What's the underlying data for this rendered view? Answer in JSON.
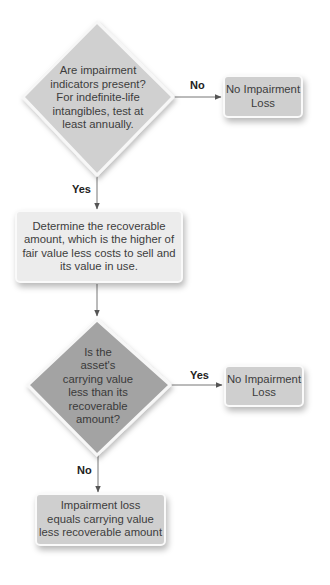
{
  "diagram": {
    "type": "flowchart",
    "title": "",
    "colors": {
      "diamond_light": "#d0d0d0",
      "diamond_dark": "#a3a3a3",
      "box_mid": "#cfcfcf",
      "box_light": "#ececec",
      "connector": "#555555",
      "text": "#3d3d3d",
      "edge_label": "#222222"
    },
    "nodes": {
      "decision_indicators": {
        "shape": "diamond",
        "lines": [
          "Are impairment",
          "indicators present?",
          "For indefinite-life",
          "intangibles, test at",
          "least annually."
        ]
      },
      "no_impairment_1": {
        "shape": "box",
        "lines": [
          "No Impairment",
          "Loss"
        ]
      },
      "determine_recoverable": {
        "shape": "box",
        "lines": [
          "Determine the recoverable",
          "amount, which is the higher of",
          "fair value less costs to sell and",
          "its value in use."
        ]
      },
      "decision_carrying_value": {
        "shape": "diamond",
        "lines": [
          "Is the",
          "asset's",
          "carrying value",
          "less than its",
          "recoverable",
          "amount?"
        ]
      },
      "no_impairment_2": {
        "shape": "box",
        "lines": [
          "No Impairment",
          "Loss"
        ]
      },
      "impairment_loss": {
        "shape": "box",
        "lines": [
          "Impairment loss",
          "equals carrying value",
          "less recoverable amount"
        ]
      }
    },
    "edges": {
      "indicators_no": {
        "from": "decision_indicators",
        "to": "no_impairment_1",
        "label": "No"
      },
      "indicators_yes": {
        "from": "decision_indicators",
        "to": "determine_recoverable",
        "label": "Yes"
      },
      "recoverable_to_decision": {
        "from": "determine_recoverable",
        "to": "decision_carrying_value",
        "label": ""
      },
      "carrying_yes": {
        "from": "decision_carrying_value",
        "to": "no_impairment_2",
        "label": "Yes"
      },
      "carrying_no": {
        "from": "decision_carrying_value",
        "to": "impairment_loss",
        "label": "No"
      }
    }
  }
}
